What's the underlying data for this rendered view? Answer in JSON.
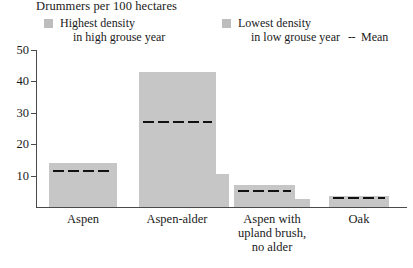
{
  "chart_data": {
    "type": "bar",
    "title": "Drummers per 100 hectares",
    "xlabel": "",
    "ylabel": "",
    "ylim": [
      0,
      50
    ],
    "yticks": [
      50,
      40,
      30,
      20,
      10
    ],
    "grid": false,
    "legend_position": "top",
    "categories": [
      "Aspen",
      "Aspen-alder",
      "Aspen with\nupland brush,\nno alder",
      "Oak"
    ],
    "series": [
      {
        "name": "Highest density in high grouse year",
        "values": [
          14,
          43,
          7,
          3.5
        ]
      },
      {
        "name": "Lowest density in low grouse year",
        "values": [
          4,
          10.5,
          2.5,
          0
        ]
      },
      {
        "name": "Mean",
        "values": [
          11.5,
          27,
          5,
          3
        ]
      }
    ],
    "colors": {
      "bar_fill": "#c6c6c6",
      "legend_swatch": "#bdbdbd",
      "mean_line": "#111111",
      "axis": "#4a4a4a",
      "text": "#1a1a1a",
      "background": "#ffffff"
    }
  },
  "legend": {
    "high": {
      "line1": "Highest density",
      "line2": "in high grouse year"
    },
    "low": {
      "line1": "Lowest density",
      "line2": "in low grouse year"
    },
    "mean": {
      "dash": "--",
      "label": "Mean"
    }
  },
  "axis": {
    "tick_labels": [
      "50",
      "40",
      "30",
      "20",
      "10"
    ]
  }
}
